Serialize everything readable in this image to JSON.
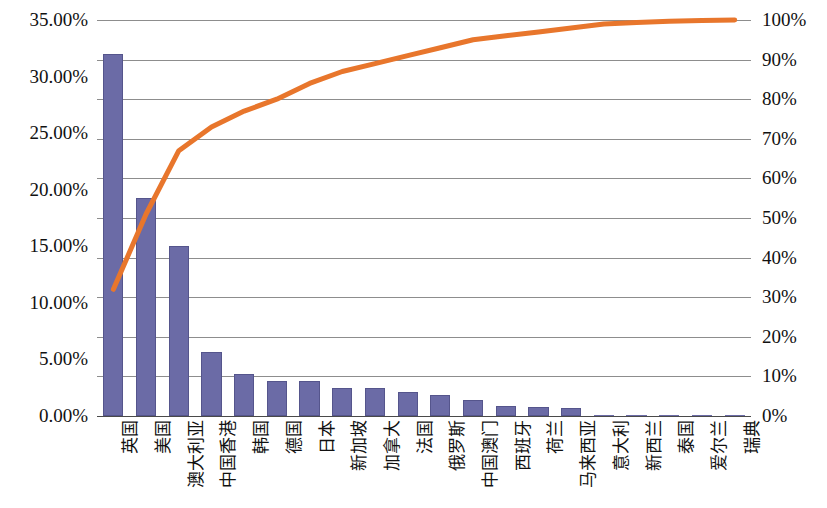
{
  "chart_data": {
    "type": "bar",
    "title": "",
    "subtitle": "",
    "xlabel": "",
    "ylabel": "",
    "grid": true,
    "legend_position": "none",
    "categories": [
      "英国",
      "美国",
      "澳大利亚",
      "中国香港",
      "韩国",
      "德国",
      "日本",
      "新加坡",
      "加拿大",
      "法国",
      "俄罗斯",
      "中国澳门",
      "西班牙",
      "荷兰",
      "马来西亚",
      "意大利",
      "新西兰",
      "泰国",
      "爱尔兰",
      "瑞典"
    ],
    "series": [
      {
        "name": "占比",
        "type": "bar",
        "axis": "left",
        "values": [
          32.0,
          19.3,
          15.0,
          5.7,
          3.7,
          3.1,
          3.1,
          2.5,
          2.5,
          2.1,
          1.9,
          1.4,
          0.9,
          0.8,
          0.7,
          0.1,
          0.05,
          0.05,
          0.05,
          0.05
        ]
      },
      {
        "name": "累计占比",
        "type": "line",
        "axis": "right",
        "values": [
          32,
          51,
          67,
          73,
          77,
          80,
          84,
          87,
          89,
          91,
          93,
          95,
          96,
          97,
          98,
          99,
          99.4,
          99.7,
          99.9,
          100
        ]
      }
    ],
    "left_axis": {
      "min": 0,
      "max": 35,
      "step": 5,
      "ticks": [
        "0.00%",
        "5.00%",
        "10.00%",
        "15.00%",
        "20.00%",
        "25.00%",
        "30.00%",
        "35.00%"
      ]
    },
    "right_axis": {
      "min": 0,
      "max": 100,
      "step": 10,
      "ticks": [
        "0%",
        "10%",
        "20%",
        "30%",
        "40%",
        "50%",
        "60%",
        "70%",
        "80%",
        "90%",
        "100%"
      ]
    },
    "colors": {
      "bar": "#6b6ba6",
      "bar_border": "#55558c",
      "line": "#e8762c",
      "grid": "#8d8d8d",
      "text": "#111111",
      "background": "#ffffff"
    }
  }
}
